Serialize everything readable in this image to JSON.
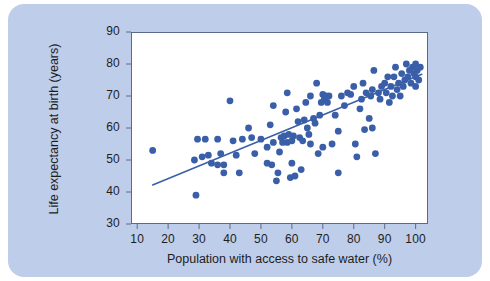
{
  "figure": {
    "background_color": "#bdcdea",
    "page_color": "#ffffff",
    "plot_background": "#ffffff",
    "marker_color": "#3a5fa8",
    "line_color": "#3a5fa8",
    "axis_color": "#5a6a88"
  },
  "chart_data": {
    "type": "scatter",
    "title": "",
    "xlabel": "Population with access to safe water (%)",
    "ylabel": "Life expectancy at birth (years)",
    "xlim": [
      8,
      104
    ],
    "ylim": [
      30,
      90
    ],
    "xticks": [
      10,
      20,
      30,
      40,
      50,
      60,
      70,
      80,
      90,
      100
    ],
    "yticks": [
      30,
      40,
      50,
      60,
      70,
      80,
      90
    ],
    "xtick_labels": [
      "10",
      "20",
      "30",
      "40",
      "50",
      "60",
      "70",
      "80",
      "90",
      "100"
    ],
    "ytick_labels": [
      "30",
      "40",
      "50",
      "60",
      "70",
      "80",
      "90"
    ],
    "grid": false,
    "legend": null,
    "marker_size": 3.4,
    "trendline": {
      "type": "linear",
      "x": [
        15,
        102
      ],
      "y": [
        42.2,
        76.8
      ],
      "slope": 0.398,
      "intercept": 36.3
    },
    "points": [
      [
        15,
        53
      ],
      [
        28.5,
        50
      ],
      [
        29,
        39
      ],
      [
        29.5,
        56.5
      ],
      [
        31,
        51
      ],
      [
        32,
        56.5
      ],
      [
        33,
        51.5
      ],
      [
        34,
        49
      ],
      [
        36,
        48.5
      ],
      [
        37,
        52
      ],
      [
        38,
        48.5
      ],
      [
        40,
        68.5
      ],
      [
        41,
        56
      ],
      [
        42,
        51.5
      ],
      [
        43,
        46
      ],
      [
        46,
        60
      ],
      [
        47,
        57
      ],
      [
        48,
        52
      ],
      [
        50,
        56.5
      ],
      [
        52,
        54
      ],
      [
        53,
        61
      ],
      [
        53.5,
        48.5
      ],
      [
        54,
        55.5
      ],
      [
        55,
        43.5
      ],
      [
        55.5,
        46
      ],
      [
        56,
        52.5
      ],
      [
        56.5,
        57
      ],
      [
        57,
        55.5
      ],
      [
        57.5,
        57.5
      ],
      [
        58,
        65
      ],
      [
        58.5,
        71
      ],
      [
        58.5,
        55.5
      ],
      [
        59,
        58
      ],
      [
        59.5,
        44.5
      ],
      [
        60,
        56
      ],
      [
        60.5,
        57.5
      ],
      [
        61,
        45
      ],
      [
        61.5,
        66
      ],
      [
        62,
        62
      ],
      [
        62.5,
        57
      ],
      [
        63,
        47
      ],
      [
        63.5,
        56
      ],
      [
        64,
        62.5
      ],
      [
        64.5,
        68
      ],
      [
        65,
        60
      ],
      [
        65.5,
        58
      ],
      [
        66,
        70
      ],
      [
        67,
        63
      ],
      [
        67.5,
        61.5
      ],
      [
        68,
        74
      ],
      [
        68.5,
        52
      ],
      [
        69,
        64
      ],
      [
        69.5,
        68
      ],
      [
        70,
        70.5
      ],
      [
        70.5,
        69
      ],
      [
        71,
        70
      ],
      [
        71.5,
        68
      ],
      [
        72,
        70
      ],
      [
        73,
        55
      ],
      [
        74,
        64
      ],
      [
        75,
        46
      ],
      [
        76,
        70
      ],
      [
        77,
        67
      ],
      [
        78,
        71
      ],
      [
        79,
        70.5
      ],
      [
        80,
        73
      ],
      [
        80.5,
        55
      ],
      [
        81,
        51
      ],
      [
        82,
        66
      ],
      [
        82.5,
        69
      ],
      [
        83,
        74
      ],
      [
        83.5,
        59.5
      ],
      [
        84,
        71
      ],
      [
        85,
        63
      ],
      [
        85.5,
        70
      ],
      [
        86,
        72
      ],
      [
        86.5,
        78
      ],
      [
        87,
        52
      ],
      [
        88,
        71
      ],
      [
        88.5,
        69
      ],
      [
        89,
        73
      ],
      [
        90,
        74
      ],
      [
        90.5,
        71
      ],
      [
        91,
        76
      ],
      [
        91.5,
        68
      ],
      [
        92,
        73
      ],
      [
        92.5,
        70
      ],
      [
        93,
        76
      ],
      [
        93.5,
        79
      ],
      [
        94,
        72
      ],
      [
        94.5,
        74
      ],
      [
        95,
        70
      ],
      [
        95.5,
        77
      ],
      [
        96,
        73
      ],
      [
        96.5,
        75
      ],
      [
        97,
        80
      ],
      [
        97.5,
        76
      ],
      [
        98,
        78
      ],
      [
        98.5,
        74
      ],
      [
        99,
        79
      ],
      [
        99.5,
        77
      ],
      [
        100,
        80
      ],
      [
        100,
        76
      ],
      [
        100,
        73
      ],
      [
        100.5,
        78
      ],
      [
        101,
        75
      ],
      [
        101.5,
        79
      ],
      [
        54,
        67
      ],
      [
        44,
        56.5
      ],
      [
        36,
        56.5
      ],
      [
        38,
        46
      ],
      [
        66,
        55
      ],
      [
        70,
        54
      ],
      [
        75,
        59
      ],
      [
        86,
        60
      ],
      [
        60,
        49
      ],
      [
        52,
        49
      ]
    ]
  }
}
